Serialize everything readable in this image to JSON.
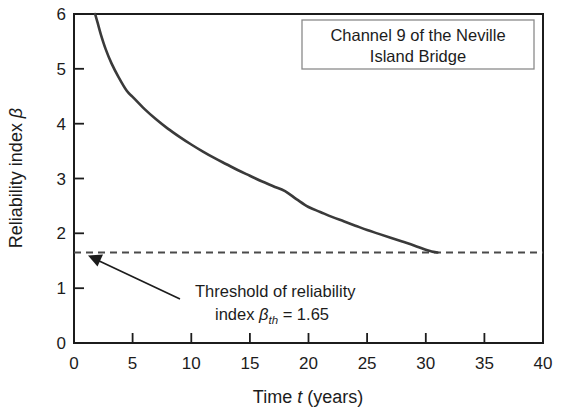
{
  "chart_data": {
    "type": "line",
    "title": "",
    "title_box_lines": [
      "Channel 9 of the Neville",
      "Island Bridge"
    ],
    "xlabel_plain": "Time t (years)",
    "xlabel_parts": {
      "pre": "Time ",
      "italic": "t",
      "post": " (years)"
    },
    "ylabel_plain": "Reliability index β",
    "ylabel_parts": {
      "pre": "Reliability index ",
      "italic": "β"
    },
    "xlim": [
      0,
      40
    ],
    "ylim": [
      0,
      6
    ],
    "xticks": [
      0,
      5,
      10,
      15,
      20,
      25,
      30,
      35,
      40
    ],
    "xtick_labels": [
      "0",
      "5",
      "10",
      "15",
      "20",
      "25",
      "30",
      "35",
      "40"
    ],
    "yticks": [
      0,
      1,
      2,
      3,
      4,
      5,
      6
    ],
    "ytick_labels": [
      "0",
      "1",
      "2",
      "3",
      "4",
      "5",
      "6"
    ],
    "grid": false,
    "legend": false,
    "series": [
      {
        "name": "Reliability index profile",
        "style": "solid",
        "color": "#3a3a3a",
        "x": [
          1.8,
          2.0,
          2.3,
          2.7,
          3.2,
          3.8,
          4.5,
          5.0,
          6.0,
          7.0,
          8.0,
          9.0,
          10.0,
          11.0,
          12.0,
          13.0,
          14.0,
          15.0,
          16.0,
          17.0,
          18.0,
          19.0,
          20.0,
          21.0,
          22.0,
          23.0,
          24.0,
          25.0,
          26.0,
          27.0,
          28.0,
          29.0,
          30.0,
          30.5,
          31.0
        ],
        "y": [
          6.0,
          5.85,
          5.62,
          5.36,
          5.1,
          4.85,
          4.6,
          4.49,
          4.27,
          4.08,
          3.91,
          3.76,
          3.62,
          3.49,
          3.37,
          3.26,
          3.15,
          3.05,
          2.95,
          2.86,
          2.77,
          2.62,
          2.48,
          2.39,
          2.3,
          2.22,
          2.14,
          2.06,
          1.99,
          1.92,
          1.85,
          1.78,
          1.7,
          1.67,
          1.65
        ]
      }
    ],
    "threshold": {
      "label": "βth = 1.65",
      "value": 1.65,
      "style": "dashed",
      "color": "#4a4a4a"
    },
    "annotations": [
      {
        "name": "threshold-annotation",
        "line1": "Threshold of reliability",
        "line2_pre": "index ",
        "line2_beta": "β",
        "line2_sub": "th",
        "line2_post": " = 1.65",
        "arrow_from": [
          180,
          299
        ],
        "arrow_to": [
          88,
          256
        ]
      }
    ],
    "colors": {
      "curve": "#3a3a3a",
      "threshold": "#4a4a4a",
      "axis": "#1c1c1c",
      "text": "#1c1c1c",
      "background": "#ffffff",
      "title_box_border": "#8a8a8a"
    }
  }
}
